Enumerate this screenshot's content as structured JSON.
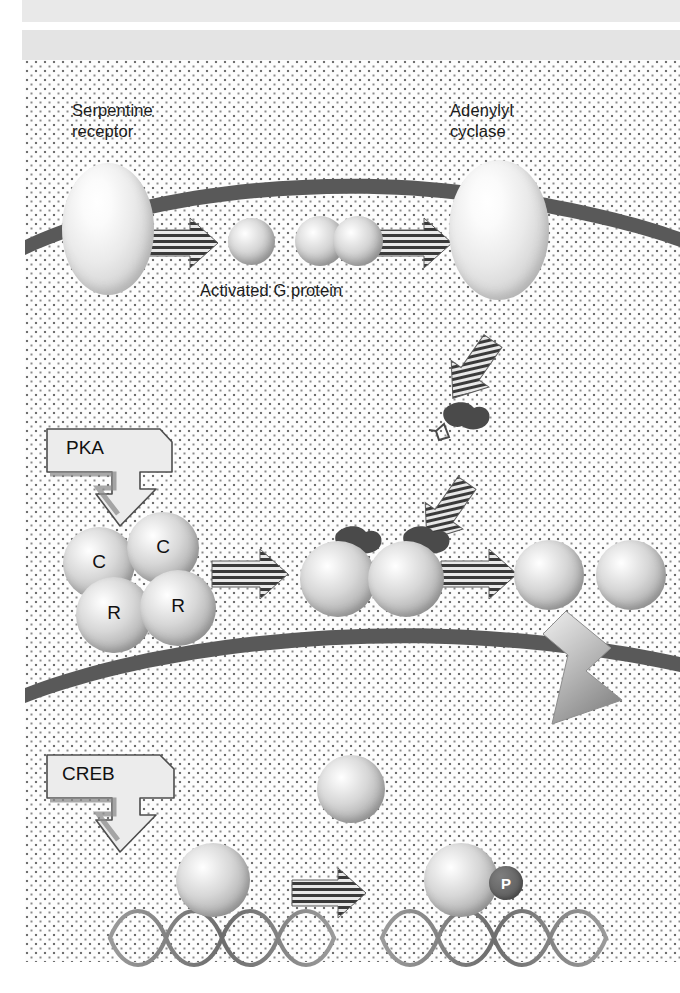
{
  "figure": {
    "labels": {
      "serpentine_receptor": "Serpentine\nreceptor",
      "adenylyl_cyclase": "Adenylyl\ncyclase",
      "activated_g_protein": "Activated G protein",
      "pka": "PKA",
      "creb": "CREB",
      "phosphate_badge": "P"
    },
    "pka_subunits": [
      {
        "id": "c-left",
        "label": "C"
      },
      {
        "id": "c-right",
        "label": "C"
      },
      {
        "id": "r-left",
        "label": "R"
      },
      {
        "id": "r-right",
        "label": "R"
      }
    ],
    "colors": {
      "membrane": "#595959",
      "background": "#ffffff",
      "stipple_dot": "#7a7a7a",
      "text": "#1b1b1b",
      "callout_fill": "#ececec",
      "callout_border": "#4d4d4d",
      "arrow_stripe_dark": "#3a3a3a",
      "arrow_stripe_light": "#e8e8e8",
      "big_arrow": "#9e9e9e",
      "camp_molecule": "#4a4a4a",
      "p_badge": "#6a6a6a",
      "band_gray": "#e9e9e9"
    },
    "structures": {
      "plasma_membrane": "curved dark band across upper cell",
      "nuclear_membrane": "curved dark band separating cytoplasm from nucleus",
      "dna_helix_count": 2,
      "cytoplasm_texture": "stippled dot pattern"
    },
    "arrows": [
      {
        "id": "receptor-to-g",
        "style": "striped",
        "direction": "right"
      },
      {
        "id": "g-to-cyclase",
        "style": "striped",
        "direction": "right"
      },
      {
        "id": "cyclase-to-camp",
        "style": "striped",
        "direction": "down-left"
      },
      {
        "id": "camp-to-pka",
        "style": "striped",
        "direction": "down-left"
      },
      {
        "id": "pka-to-camp-bound",
        "style": "striped",
        "direction": "right"
      },
      {
        "id": "camp-bound-to-free-c",
        "style": "striped",
        "direction": "right"
      },
      {
        "id": "c-into-nucleus",
        "style": "solid-gray",
        "direction": "down-right"
      },
      {
        "id": "creb-to-phospho-creb",
        "style": "striped",
        "direction": "right"
      }
    ]
  }
}
